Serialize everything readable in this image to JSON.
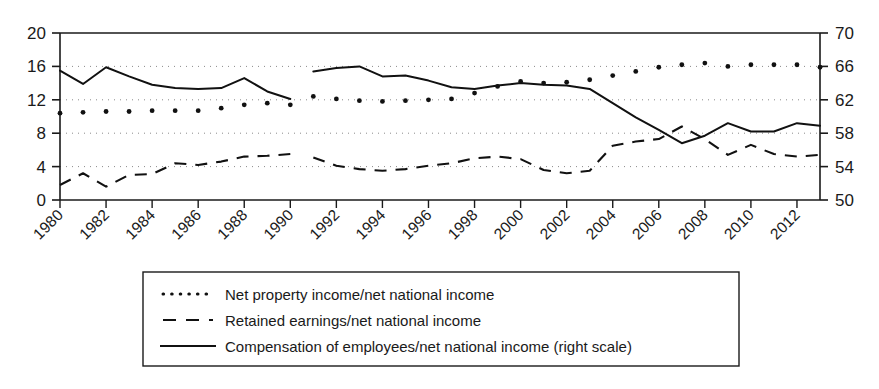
{
  "chart_data": {
    "type": "line",
    "title": "",
    "subtitle": "",
    "xlabel": "",
    "ylabel": "",
    "grid": true,
    "legend_position": "bottom",
    "x": [
      1980,
      1981,
      1982,
      1983,
      1984,
      1985,
      1986,
      1987,
      1988,
      1989,
      1990,
      1991,
      1992,
      1993,
      1994,
      1995,
      1996,
      1997,
      1998,
      1999,
      2000,
      2001,
      2002,
      2003,
      2004,
      2005,
      2006,
      2007,
      2008,
      2009,
      2010,
      2011,
      2012,
      2013
    ],
    "xlim": [
      1980,
      2013
    ],
    "xticks": [
      1980,
      1982,
      1984,
      1986,
      1988,
      1990,
      1992,
      1994,
      1996,
      1998,
      2000,
      2002,
      2004,
      2006,
      2008,
      2010,
      2012
    ],
    "xtick_labels": [
      "1980",
      "1982",
      "1984",
      "1986",
      "1988",
      "1990",
      "1992",
      "1994",
      "1996",
      "1998",
      "2000",
      "2002",
      "2004",
      "2006",
      "2008",
      "2010",
      "2012"
    ],
    "left_axis": {
      "ylim": [
        0,
        20
      ],
      "yticks": [
        0,
        4,
        8,
        12,
        16,
        20
      ],
      "ytick_labels": [
        "0",
        "4",
        "8",
        "12",
        "16",
        "20"
      ]
    },
    "right_axis": {
      "ylim": [
        50,
        70
      ],
      "yticks": [
        50,
        54,
        58,
        62,
        66,
        70
      ],
      "ytick_labels": [
        "50",
        "54",
        "58",
        "62",
        "66",
        "70"
      ]
    },
    "series": [
      {
        "name": "Net property income/net national income",
        "key": "net_property_income",
        "style": "dotted",
        "axis": "left",
        "color": "#111111",
        "segments": [
          {
            "x": [
              1980,
              1981,
              1982,
              1983,
              1984,
              1985,
              1986,
              1987,
              1988,
              1989,
              1990
            ],
            "values": [
              10.4,
              10.5,
              10.6,
              10.6,
              10.7,
              10.7,
              10.7,
              11.0,
              11.4,
              11.6,
              11.4
            ]
          },
          {
            "x": [
              1991,
              1992,
              1993,
              1994,
              1995,
              1996,
              1997,
              1998,
              1999,
              2000,
              2001,
              2002,
              2003,
              2004,
              2005,
              2006,
              2007,
              2008,
              2009,
              2010,
              2011,
              2012,
              2013
            ],
            "values": [
              12.4,
              12.1,
              11.9,
              11.8,
              11.9,
              12.0,
              12.1,
              12.8,
              13.6,
              14.2,
              14.0,
              14.1,
              14.4,
              14.9,
              15.4,
              15.9,
              16.2,
              16.4,
              16.0,
              16.2,
              16.2,
              16.2,
              15.9
            ]
          }
        ]
      },
      {
        "name": "Retained earnings/net national income",
        "key": "retained_earnings",
        "style": "dashed",
        "axis": "left",
        "color": "#111111",
        "segments": [
          {
            "x": [
              1980,
              1981,
              1982,
              1983,
              1984,
              1985,
              1986,
              1987,
              1988,
              1989,
              1990
            ],
            "values": [
              1.8,
              3.2,
              1.6,
              3.0,
              3.1,
              4.4,
              4.2,
              4.6,
              5.2,
              5.3,
              5.5
            ]
          },
          {
            "x": [
              1991,
              1992,
              1993,
              1994,
              1995,
              1996,
              1997,
              1998,
              1999,
              2000,
              2001,
              2002,
              2003,
              2004,
              2005,
              2006,
              2007,
              2008,
              2009,
              2010,
              2011,
              2012,
              2013
            ],
            "values": [
              5.1,
              4.1,
              3.7,
              3.5,
              3.7,
              4.1,
              4.4,
              5.0,
              5.2,
              4.9,
              3.6,
              3.2,
              3.5,
              6.5,
              7.0,
              7.3,
              8.8,
              7.3,
              5.4,
              6.6,
              5.5,
              5.2,
              5.4
            ]
          }
        ]
      },
      {
        "name": "Compensation of employees/net national income (right scale)",
        "key": "compensation_of_employees",
        "style": "solid",
        "axis": "right",
        "color": "#111111",
        "segments": [
          {
            "x": [
              1980,
              1981,
              1982,
              1983,
              1984,
              1985,
              1986,
              1987,
              1988,
              1989,
              1990
            ],
            "values": [
              65.5,
              63.9,
              65.9,
              64.8,
              63.8,
              63.4,
              63.3,
              63.4,
              64.6,
              63.0,
              62.1
            ]
          },
          {
            "x": [
              1991,
              1992,
              1993,
              1994,
              1995,
              1996,
              1997,
              1998,
              1999,
              2000,
              2001,
              2002,
              2003,
              2004,
              2005,
              2006,
              2007,
              2008,
              2009,
              2010,
              2011,
              2012,
              2013
            ],
            "values": [
              65.4,
              65.8,
              66.0,
              64.8,
              64.9,
              64.3,
              63.5,
              63.3,
              63.7,
              64.0,
              63.8,
              63.7,
              63.3,
              61.6,
              59.9,
              58.4,
              56.8,
              57.7,
              59.2,
              58.2,
              58.2,
              59.2,
              58.9
            ]
          }
        ]
      }
    ]
  },
  "legend": {
    "entries": [
      {
        "marker": "dotted-line-swatch",
        "label": "Net property income/net national income"
      },
      {
        "marker": "dashed-line-swatch",
        "label": "Retained earnings/net national income"
      },
      {
        "marker": "solid-line-swatch",
        "label": "Compensation of employees/net national income (right scale)"
      }
    ]
  },
  "colors": {
    "axis": "#1a1a1a",
    "grid": "#8a8a8a",
    "series": "#111111",
    "background": "#ffffff"
  }
}
